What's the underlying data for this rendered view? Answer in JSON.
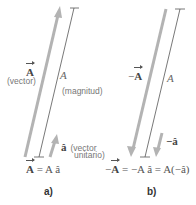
{
  "colors": {
    "thick_arrow": "#b3b3b3",
    "thin_line": "#555555",
    "label_text": "#777777",
    "math_text": "#444444"
  },
  "panel_a": {
    "tag": "a)",
    "vector_symbol": "A",
    "vector_caption": "(vector)",
    "magnitude_symbol": "A",
    "magnitude_caption": "(magnitud)",
    "unit_symbol": "â",
    "unit_caption_line1": "(vector",
    "unit_caption_line2": "unitario)",
    "equation": {
      "lhs_vector": "A",
      "rhs": " = A â"
    }
  },
  "panel_b": {
    "tag": "b)",
    "vector_prefix": "−",
    "vector_symbol": "A",
    "magnitude_symbol": "A",
    "unit_symbol": "−â",
    "equation": {
      "lhs_prefix": "−",
      "lhs_vector": "A",
      "rhs": " = −A â = A(−â)"
    }
  }
}
